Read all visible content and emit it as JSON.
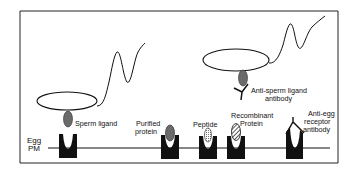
{
  "figure": {
    "membrane_label_line1": "Egg",
    "membrane_label_line2": "PM",
    "labels": {
      "sperm_ligand": "Sperm ligand",
      "purified_line1": "Purified",
      "purified_line2": "protein",
      "peptide": "Peptide",
      "recombinant_line1": "Recombinant",
      "recombinant_line2": "Protein",
      "anti_sperm_line1": "Anti-sperm ligand",
      "anti_sperm_line2": "antibody",
      "anti_egg_line1": "Anti-egg",
      "anti_egg_line2": "receptor",
      "anti_egg_line3": "antibody"
    },
    "colors": {
      "stroke": "#111111",
      "receptor_fill": "#111111",
      "ligand_fill": "#6b6b6b",
      "background": "#ffffff"
    }
  }
}
